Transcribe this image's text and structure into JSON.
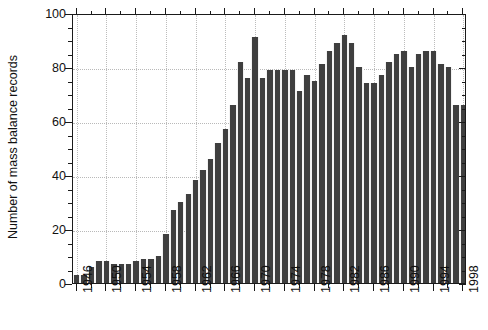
{
  "chart_data": {
    "type": "bar",
    "title": "",
    "xlabel": "",
    "ylabel": "Number of mass balance records",
    "ylim": [
      0,
      100
    ],
    "xlim": [
      1945.5,
      1998.5
    ],
    "ytick_labels": [
      "0",
      "20",
      "40",
      "60",
      "80",
      "100"
    ],
    "ytick_values": [
      0,
      20,
      40,
      60,
      80,
      100
    ],
    "ytick_minor_step": 5,
    "xtick_labels": [
      "1946",
      "1950",
      "1954",
      "1958",
      "1962",
      "1966",
      "1970",
      "1974",
      "1978",
      "1982",
      "1986",
      "1990",
      "1994",
      "1998"
    ],
    "xtick_values": [
      1946,
      1950,
      1954,
      1958,
      1962,
      1966,
      1970,
      1974,
      1978,
      1982,
      1986,
      1990,
      1994,
      1998
    ],
    "xtick_minor_step": 2,
    "grid": true,
    "grid_style": "dotted",
    "legend": false,
    "bar_color": "#3f3f3f",
    "axis_color": "#1a1a1a",
    "grid_color": "#bcbcbc",
    "categories": [
      1946,
      1947,
      1948,
      1949,
      1950,
      1951,
      1952,
      1953,
      1954,
      1955,
      1956,
      1957,
      1958,
      1959,
      1960,
      1961,
      1962,
      1963,
      1964,
      1965,
      1966,
      1967,
      1968,
      1969,
      1970,
      1971,
      1972,
      1973,
      1974,
      1975,
      1976,
      1977,
      1978,
      1979,
      1980,
      1981,
      1982,
      1983,
      1984,
      1985,
      1986,
      1987,
      1988,
      1989,
      1990,
      1991,
      1992,
      1993,
      1994,
      1995,
      1996,
      1997,
      1998
    ],
    "values": [
      3,
      3,
      6,
      8,
      8,
      7,
      7,
      7,
      8,
      9,
      9,
      10,
      18,
      27,
      30,
      33,
      38,
      42,
      46,
      52,
      57,
      66,
      82,
      76,
      91,
      76,
      79,
      79,
      79,
      79,
      71,
      77,
      75,
      81,
      86,
      89,
      92,
      89,
      80,
      74,
      74,
      77,
      82,
      85,
      86,
      80,
      85,
      86,
      86,
      81,
      80,
      66,
      66
    ],
    "series_name": "Number of mass balance records"
  }
}
